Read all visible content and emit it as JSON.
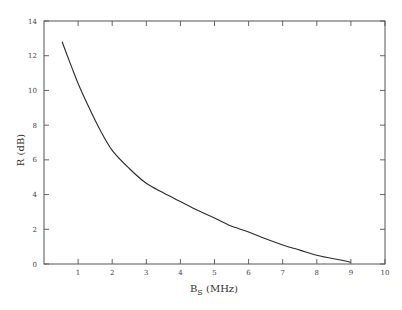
{
  "chart_data": {
    "type": "line",
    "title": "",
    "xlabel": "B_S (MHz)",
    "xlabel_main": "B",
    "xlabel_sub": "S",
    "xlabel_unit": " (MHz)",
    "ylabel": "R (dB)",
    "xlim": [
      0,
      10
    ],
    "ylim": [
      0,
      14
    ],
    "xticks": [
      1,
      2,
      3,
      4,
      5,
      6,
      7,
      8,
      9,
      10
    ],
    "yticks": [
      0,
      2,
      4,
      6,
      8,
      10,
      12,
      14
    ],
    "grid": false,
    "legend": null,
    "series": [
      {
        "name": "R",
        "x": [
          0.53,
          0.8,
          1.0,
          1.3,
          1.65,
          2.0,
          2.5,
          3.0,
          3.5,
          4.0,
          4.5,
          5.0,
          5.47,
          6.0,
          6.5,
          7.0,
          7.5,
          8.0,
          8.5,
          9.0
        ],
        "y": [
          12.8,
          11.4,
          10.4,
          9.1,
          7.7,
          6.55,
          5.5,
          4.65,
          4.1,
          3.6,
          3.1,
          2.65,
          2.2,
          1.85,
          1.45,
          1.1,
          0.8,
          0.5,
          0.3,
          0.1
        ]
      }
    ],
    "colors": {
      "line": "#2a2a2a",
      "frame": "#555555"
    }
  }
}
